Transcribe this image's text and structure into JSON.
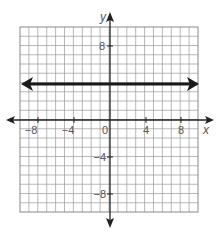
{
  "chart_data": {
    "type": "line",
    "title": "",
    "xlabel": "x",
    "ylabel": "y",
    "xlim": [
      -10,
      10
    ],
    "ylim": [
      -10,
      10
    ],
    "grid": true,
    "grid_step": 1,
    "x_ticks": [
      -8,
      -4,
      0,
      4,
      8
    ],
    "x_tick_labels": [
      "−8",
      "−4",
      "0",
      "4",
      "8"
    ],
    "y_ticks": [
      8,
      -4,
      -8
    ],
    "y_tick_labels": [
      "8",
      "−4",
      "−8"
    ],
    "series": [
      {
        "name": "y = 4",
        "equation": "y = 4",
        "x": [
          -10,
          10
        ],
        "y": [
          4,
          4
        ],
        "style": "bold line with arrowheads on both ends",
        "color": "#1a1a1a"
      }
    ],
    "legend": null
  },
  "colors": {
    "grid": "#9a9a9a",
    "axis": "#222222",
    "line": "#1a1a1a",
    "text": "#555555",
    "border": "#8a8a8a"
  },
  "labels": {
    "x_axis": "x",
    "y_axis": "y",
    "origin": "0",
    "x_neg8": "−8",
    "x_neg4": "−4",
    "x_4": "4",
    "x_8": "8",
    "y_8": "8",
    "y_neg4": "−4",
    "y_neg8": "−8"
  }
}
